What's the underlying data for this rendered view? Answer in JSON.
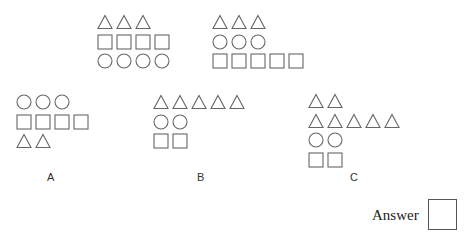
{
  "puzzle": {
    "stroke_color": "#666666",
    "examples": [
      {
        "id": "example-1",
        "x": 97,
        "y": 14,
        "rows": [
          {
            "shape": "triangle",
            "count": 3
          },
          {
            "shape": "square",
            "count": 4
          },
          {
            "shape": "circle",
            "count": 4
          }
        ]
      },
      {
        "id": "example-2",
        "x": 212,
        "y": 14,
        "rows": [
          {
            "shape": "triangle",
            "count": 3
          },
          {
            "shape": "circle",
            "count": 3
          },
          {
            "shape": "square",
            "count": 5
          }
        ]
      }
    ],
    "options": [
      {
        "label": "A",
        "x": 16,
        "y": 94,
        "label_x": 47,
        "rows": [
          {
            "shape": "circle",
            "count": 3
          },
          {
            "shape": "square",
            "count": 4
          },
          {
            "shape": "triangle",
            "count": 2
          }
        ]
      },
      {
        "label": "B",
        "x": 153,
        "y": 94,
        "label_x": 197,
        "rows": [
          {
            "shape": "triangle",
            "count": 5
          },
          {
            "shape": "circle",
            "count": 2
          },
          {
            "shape": "square",
            "count": 2
          }
        ]
      },
      {
        "label": "C",
        "x": 308,
        "y": 93,
        "label_x": 350,
        "rows": [
          {
            "shape": "triangle",
            "count": 2
          },
          {
            "shape": "triangle",
            "count": 5
          },
          {
            "shape": "circle",
            "count": 2
          },
          {
            "shape": "square",
            "count": 2
          }
        ]
      }
    ],
    "answer": {
      "label": "Answer",
      "value": ""
    }
  }
}
